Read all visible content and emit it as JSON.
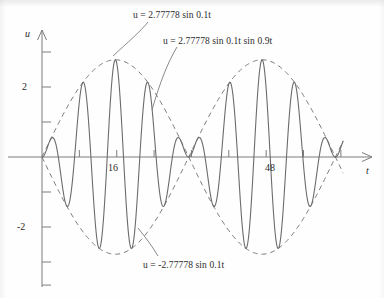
{
  "chart_data": {
    "type": "line",
    "title": "",
    "xlabel": "t",
    "ylabel": "u",
    "xlim": [
      -1.5,
      66
    ],
    "ylim": [
      -3.6,
      3.4
    ],
    "grid": false,
    "legend_position": "inline-annotations",
    "x_ticks": [
      8,
      16,
      24,
      32,
      40,
      48,
      56,
      64
    ],
    "x_tick_labels": [
      "",
      "16",
      "",
      "",
      "",
      "48",
      "",
      ""
    ],
    "y_ticks": [
      -3,
      -2,
      -1,
      1,
      2,
      3
    ],
    "y_tick_labels": [
      "",
      "-2",
      "",
      "",
      "2",
      ""
    ],
    "amplitude": 2.77778,
    "envelope_frequency": 0.1,
    "carrier_frequency": 0.9,
    "series": [
      {
        "name": "u = 2.77778 sin 0.1t sin 0.9t",
        "style": "solid",
        "color": "#6b6b6b",
        "formula": "2.77778*sin(0.1*t)*sin(0.9*t)"
      },
      {
        "name": "u = 2.77778 sin 0.1t",
        "style": "dashed",
        "color": "#7a7a7a",
        "formula": "2.77778*sin(0.1*t)"
      },
      {
        "name": "u = -2.77778 sin 0.1t",
        "style": "dashed",
        "color": "#7a7a7a",
        "formula": "-2.77778*sin(0.1*t)"
      }
    ],
    "annotations": [
      {
        "id": "upper-envelope-label",
        "text": "u = 2.77778 sin 0.1t",
        "x_px": 133,
        "y_px": 10
      },
      {
        "id": "beat-curve-label",
        "text": "u = 2.77778 sin 0.1t sin 0.9t",
        "x_px": 163,
        "y_px": 36
      },
      {
        "id": "lower-envelope-label",
        "text": "u = -2.77778 sin 0.1t",
        "x_px": 143,
        "y_px": 260
      }
    ]
  },
  "axes": {
    "y_axis_name": "u",
    "x_axis_name": "t",
    "x_label_16": "16",
    "x_label_48": "48",
    "y_label_pos2": "2",
    "y_label_neg2": "-2"
  },
  "colors": {
    "curve": "#6b6b6b",
    "envelope": "#7a7a7a",
    "axis": "#7c7c7c",
    "text": "#2b2b2b",
    "background": "#fefefe"
  }
}
